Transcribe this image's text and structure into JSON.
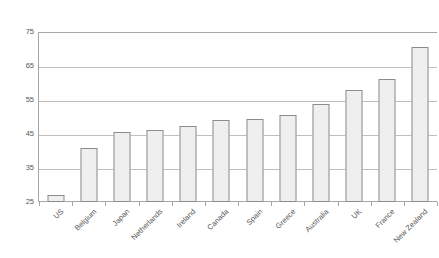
{
  "chart_data": {
    "type": "bar",
    "title": "",
    "subtitle": "",
    "xlabel": "",
    "ylabel": "",
    "ylim": [
      25,
      75
    ],
    "yticks": [
      25,
      35,
      45,
      55,
      65,
      75
    ],
    "ytick_labels": [
      "25",
      "35",
      "45",
      "55",
      "65",
      "75"
    ],
    "grid": true,
    "legend": false,
    "legend_position": "none",
    "categories": [
      "US",
      "Belgium",
      "Japan",
      "Netherlands",
      "Ireland",
      "Canada",
      "Spain",
      "Greece",
      "Australia",
      "UK",
      "France",
      "New Zealand"
    ],
    "values": [
      27,
      41,
      45.5,
      46.2,
      47.5,
      49,
      49.4,
      50.6,
      53.7,
      58,
      61.2,
      70.5
    ],
    "bar_fill_color": "#efefef",
    "bar_border_color": "#8c8c8c",
    "gridline_color": "#bfbfbf",
    "axis_color": "#a6a6a6",
    "text_color": "#595959"
  }
}
